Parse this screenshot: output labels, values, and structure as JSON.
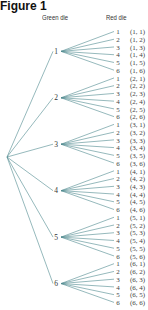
{
  "figure": {
    "title": "Figure 1",
    "header_green": "Green die",
    "header_red": "Red die"
  },
  "tree": {
    "line_color": "#4f8a8f",
    "root": "",
    "branches": [
      {
        "label": "1",
        "leaves": [
          {
            "label": "1",
            "outcome": "(1, 1)"
          },
          {
            "label": "2",
            "outcome": "(1, 2)"
          },
          {
            "label": "3",
            "outcome": "(1, 3)"
          },
          {
            "label": "4",
            "outcome": "(1, 4)"
          },
          {
            "label": "5",
            "outcome": "(1, 5)"
          },
          {
            "label": "6",
            "outcome": "(1, 6)"
          }
        ]
      },
      {
        "label": "2",
        "leaves": [
          {
            "label": "1",
            "outcome": "(2, 1)"
          },
          {
            "label": "2",
            "outcome": "(2, 2)"
          },
          {
            "label": "3",
            "outcome": "(2, 3)"
          },
          {
            "label": "4",
            "outcome": "(2, 4)"
          },
          {
            "label": "5",
            "outcome": "(2, 5)"
          },
          {
            "label": "6",
            "outcome": "(2, 6)"
          }
        ]
      },
      {
        "label": "3",
        "leaves": [
          {
            "label": "1",
            "outcome": "(3, 1)"
          },
          {
            "label": "2",
            "outcome": "(3, 2)"
          },
          {
            "label": "3",
            "outcome": "(3, 3)"
          },
          {
            "label": "4",
            "outcome": "(3, 4)"
          },
          {
            "label": "5",
            "outcome": "(3, 5)"
          },
          {
            "label": "6",
            "outcome": "(3, 6)"
          }
        ]
      },
      {
        "label": "4",
        "leaves": [
          {
            "label": "1",
            "outcome": "(4, 1)"
          },
          {
            "label": "2",
            "outcome": "(4, 2)"
          },
          {
            "label": "3",
            "outcome": "(4, 3)"
          },
          {
            "label": "4",
            "outcome": "(4, 4)"
          },
          {
            "label": "5",
            "outcome": "(4, 5)"
          },
          {
            "label": "6",
            "outcome": "(4, 6)"
          }
        ]
      },
      {
        "label": "5",
        "leaves": [
          {
            "label": "1",
            "outcome": "(5, 1)"
          },
          {
            "label": "2",
            "outcome": "(5, 2)"
          },
          {
            "label": "3",
            "outcome": "(5, 3)"
          },
          {
            "label": "4",
            "outcome": "(5, 4)"
          },
          {
            "label": "5",
            "outcome": "(5, 5)"
          },
          {
            "label": "6",
            "outcome": "(5, 6)"
          }
        ]
      },
      {
        "label": "6",
        "leaves": [
          {
            "label": "1",
            "outcome": "(6, 1)"
          },
          {
            "label": "2",
            "outcome": "(6, 2)"
          },
          {
            "label": "3",
            "outcome": "(6, 3)"
          },
          {
            "label": "4",
            "outcome": "(6, 4)"
          },
          {
            "label": "5",
            "outcome": "(6, 5)"
          },
          {
            "label": "6",
            "outcome": "(6, 6)"
          }
        ]
      }
    ]
  }
}
